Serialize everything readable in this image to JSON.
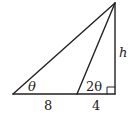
{
  "diagram": {
    "type": "right-triangle-with-cevian",
    "labels": {
      "angle_left": "θ",
      "angle_middle": "2θ",
      "base_left_segment": "8",
      "base_right_segment": "4",
      "height": "h"
    },
    "colors": {
      "stroke": "#222222",
      "background": "#ffffff"
    }
  }
}
